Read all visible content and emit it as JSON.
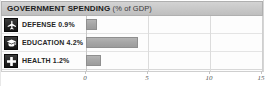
{
  "header": {
    "title": "GOVERNMENT SPENDING",
    "unit": "(% of GDP)"
  },
  "chart_data": {
    "type": "bar",
    "orientation": "horizontal",
    "title": "GOVERNMENT SPENDING (% of GDP)",
    "xlabel": "",
    "ylabel": "",
    "xlim": [
      0,
      15
    ],
    "grid": true,
    "legend": "none",
    "categories": [
      "DEFENSE",
      "EDUCATION",
      "HEALTH"
    ],
    "values": [
      0.9,
      4.2,
      1.2
    ],
    "value_labels": [
      "0.9%",
      "4.2%",
      "1.2%"
    ],
    "tick_labels": [
      "0",
      "5",
      "10",
      "15"
    ],
    "tick_values": [
      0,
      5,
      10,
      15
    ],
    "bar_color": "#a6a6a6"
  },
  "rows": [
    {
      "icon": "fighter-jet-icon",
      "label": "DEFENSE 0.9%",
      "name": "DEFENSE",
      "value": 0.9,
      "value_label": "0.9%"
    },
    {
      "icon": "graduation-cap-icon",
      "label": "EDUCATION 4.2%",
      "name": "EDUCATION",
      "value": 4.2,
      "value_label": "4.2%"
    },
    {
      "icon": "medical-cross-icon",
      "label": "HEALTH 1.2%",
      "name": "HEALTH",
      "value": 1.2,
      "value_label": "1.2%"
    }
  ],
  "axis": {
    "ticks": [
      {
        "label": "0",
        "value": 0
      },
      {
        "label": "5",
        "value": 5
      },
      {
        "label": "10",
        "value": 10
      },
      {
        "label": "15",
        "value": 15
      }
    ]
  }
}
